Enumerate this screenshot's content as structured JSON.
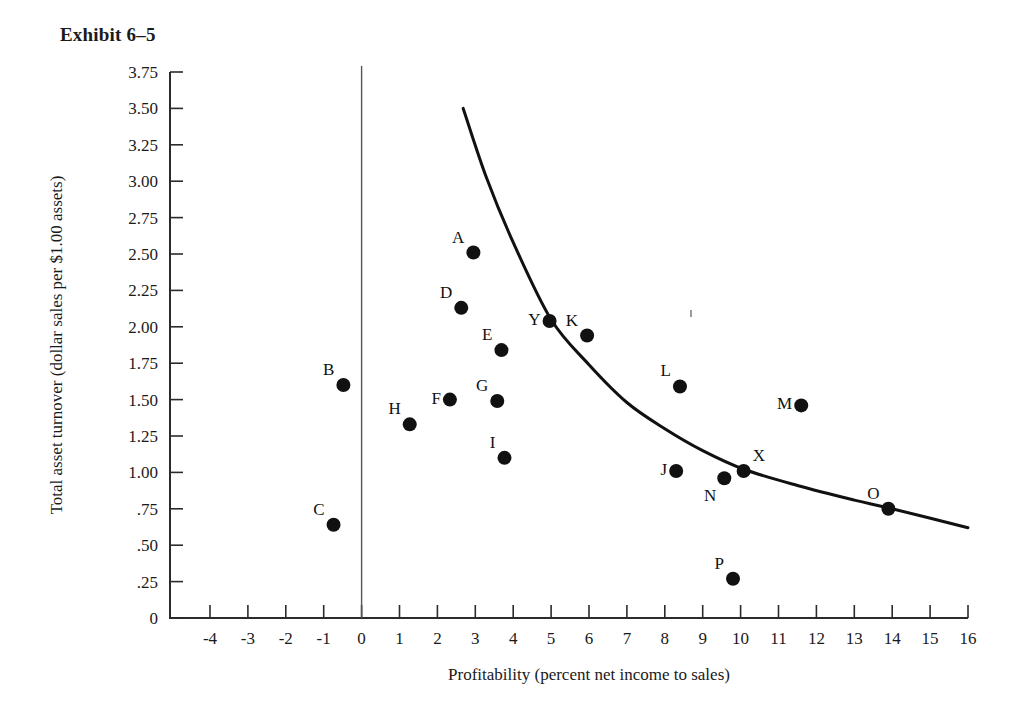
{
  "title": "Exhibit 6–5",
  "chart_data": {
    "type": "scatter",
    "title": "Exhibit 6–5",
    "xlabel": "Profitability (percent net income to sales)",
    "ylabel": "Total asset turnover (dollar sales per $1.00 assets)",
    "xlim": [
      -4,
      16
    ],
    "ylim": [
      0,
      3.75
    ],
    "grid": false,
    "legend": "none",
    "xticks": [
      "-4",
      "-3",
      "-2",
      "-1",
      "0",
      "1",
      "2",
      "3",
      "4",
      "5",
      "6",
      "7",
      "8",
      "9",
      "10",
      "11",
      "12",
      "13",
      "14",
      "15",
      "16"
    ],
    "xtick_values": [
      -4,
      -3,
      -2,
      -1,
      0,
      1,
      2,
      3,
      4,
      5,
      6,
      7,
      8,
      9,
      10,
      11,
      12,
      13,
      14,
      15,
      16
    ],
    "yticks": [
      "3.75",
      "3.50",
      "3.25",
      "3.00",
      "2.75",
      "2.50",
      "2.25",
      "2.00",
      "1.75",
      "1.50",
      "1.25",
      "1.00",
      ".75",
      ".50",
      ".25",
      "0"
    ],
    "ytick_values": [
      3.75,
      3.5,
      3.25,
      3.0,
      2.75,
      2.5,
      2.25,
      2.0,
      1.75,
      1.5,
      1.25,
      1.0,
      0.75,
      0.5,
      0.25,
      0
    ],
    "vertical_reference_line_x": 0,
    "points": [
      {
        "label": "A",
        "x": 2.95,
        "y": 2.51,
        "label_pos": "up-left"
      },
      {
        "label": "B",
        "x": -0.48,
        "y": 1.6,
        "label_pos": "up-left"
      },
      {
        "label": "C",
        "x": -0.74,
        "y": 0.64,
        "label_pos": "up-left"
      },
      {
        "label": "D",
        "x": 2.63,
        "y": 2.13,
        "label_pos": "up-left"
      },
      {
        "label": "E",
        "x": 3.69,
        "y": 1.84,
        "label_pos": "up-left"
      },
      {
        "label": "F",
        "x": 2.33,
        "y": 1.5,
        "label_pos": "left"
      },
      {
        "label": "G",
        "x": 3.58,
        "y": 1.49,
        "label_pos": "up-left"
      },
      {
        "label": "H",
        "x": 1.27,
        "y": 1.33,
        "label_pos": "up-left"
      },
      {
        "label": "I",
        "x": 3.77,
        "y": 1.1,
        "label_pos": "up-left"
      },
      {
        "label": "J",
        "x": 8.3,
        "y": 1.01,
        "label_pos": "left"
      },
      {
        "label": "K",
        "x": 5.95,
        "y": 1.94,
        "label_pos": "up-left"
      },
      {
        "label": "L",
        "x": 8.4,
        "y": 1.59,
        "label_pos": "up-left"
      },
      {
        "label": "M",
        "x": 11.6,
        "y": 1.46,
        "label_pos": "left"
      },
      {
        "label": "N",
        "x": 9.57,
        "y": 0.96,
        "label_pos": "down-left"
      },
      {
        "label": "O",
        "x": 13.9,
        "y": 0.75,
        "label_pos": "up-left"
      },
      {
        "label": "P",
        "x": 9.8,
        "y": 0.27,
        "label_pos": "up-left"
      },
      {
        "label": "X",
        "x": 10.08,
        "y": 1.01,
        "label_pos": "up-right"
      },
      {
        "label": "Y",
        "x": 4.96,
        "y": 2.04,
        "label_pos": "left"
      }
    ],
    "fit_curve": {
      "description": "downward sloping hyperbolic trend line",
      "start": {
        "x": 2.68,
        "y": 3.5
      },
      "end": {
        "x": 16.0,
        "y": 0.62
      },
      "points": [
        {
          "x": 2.68,
          "y": 3.5
        },
        {
          "x": 3.3,
          "y": 3.02
        },
        {
          "x": 4.0,
          "y": 2.58
        },
        {
          "x": 5.0,
          "y": 2.05
        },
        {
          "x": 6.0,
          "y": 1.74
        },
        {
          "x": 7.0,
          "y": 1.48
        },
        {
          "x": 8.0,
          "y": 1.3
        },
        {
          "x": 9.0,
          "y": 1.15
        },
        {
          "x": 10.1,
          "y": 1.02
        },
        {
          "x": 11.5,
          "y": 0.91
        },
        {
          "x": 13.0,
          "y": 0.81
        },
        {
          "x": 14.0,
          "y": 0.75
        },
        {
          "x": 16.0,
          "y": 0.62
        }
      ]
    }
  }
}
